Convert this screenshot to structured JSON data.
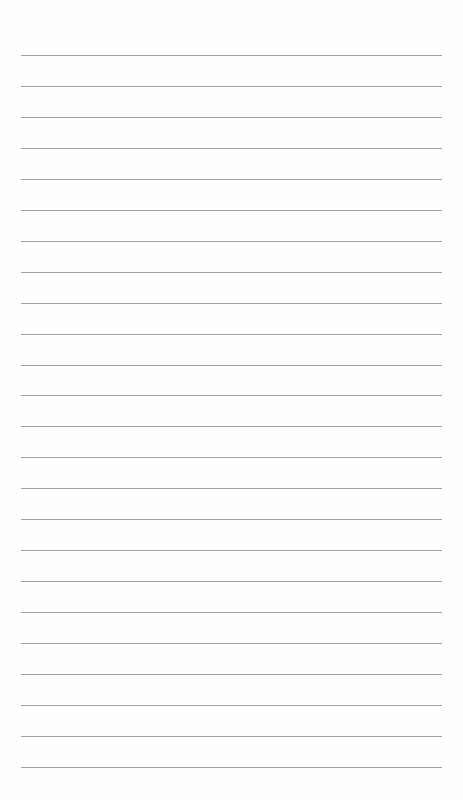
{
  "page": {
    "type": "blank lined paper",
    "background_color": "#fefefe",
    "rule_color": "#a2a2a2",
    "rule_count": 24,
    "first_rule_y": 55,
    "rule_spacing": 30.95,
    "rule_left": 21,
    "rule_width": 421
  }
}
